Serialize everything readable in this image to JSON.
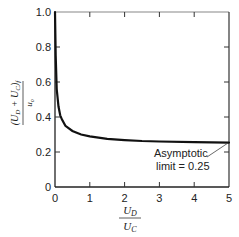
{
  "chart_data": {
    "type": "line",
    "title": "",
    "xlabel": "U_D / U_C",
    "ylabel": "(U_D + U_C)_f / u_o",
    "xlim": [
      0,
      5
    ],
    "ylim": [
      0,
      1.0
    ],
    "grid": false,
    "legend": null,
    "x_ticks": [
      "0",
      "1",
      "2",
      "3",
      "4",
      "5"
    ],
    "y_ticks": [
      "0",
      "0.2",
      "0.4",
      "0.6",
      "0.8",
      "1.0"
    ],
    "series": [
      {
        "name": "curve",
        "x": [
          0.0,
          0.02,
          0.05,
          0.1,
          0.15,
          0.2,
          0.3,
          0.5,
          0.75,
          1.0,
          1.5,
          2.0,
          2.5,
          3.0,
          4.0,
          5.0
        ],
        "y": [
          1.0,
          0.75,
          0.56,
          0.46,
          0.41,
          0.385,
          0.35,
          0.32,
          0.3,
          0.29,
          0.275,
          0.268,
          0.263,
          0.26,
          0.256,
          0.254
        ]
      }
    ],
    "annotations": [
      {
        "text_line1": "Asymptotic",
        "text_line2": "limit = 0.25",
        "points_to": [
          5,
          0.25
        ]
      }
    ]
  },
  "labels": {
    "ylabel_num_left": "(U",
    "ylabel_num_D": "D",
    "ylabel_num_plus": " + U",
    "ylabel_num_C": "C",
    "ylabel_num_right": ")",
    "ylabel_num_f": "f",
    "ylabel_den": "u",
    "ylabel_den_sub": "o",
    "xlabel_num": "U",
    "xlabel_num_sub": "D",
    "xlabel_den": "U",
    "xlabel_den_sub": "C",
    "annot_line1": "Asymptotic",
    "annot_line2": "limit = 0.25"
  }
}
